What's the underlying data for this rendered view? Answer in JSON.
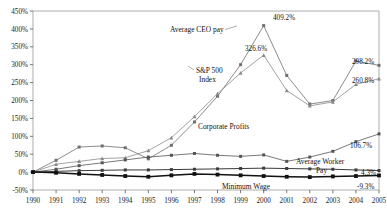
{
  "chart": {
    "type": "line",
    "title": "",
    "xlabel": "",
    "ylabel": "",
    "grid": false,
    "legend_position": "inline-annotations",
    "axis": {
      "ylim": [
        -50,
        450
      ],
      "ytick_step": 50,
      "ytick_labels": [
        "450%",
        "400%",
        "350%",
        "300%",
        "250%",
        "200%",
        "150%",
        "100%",
        "50%",
        "0%",
        "-50%"
      ],
      "ytick_values": [
        450,
        400,
        350,
        300,
        250,
        200,
        150,
        100,
        50,
        0,
        -50
      ],
      "xtick_labels": [
        "1990",
        "1991",
        "1992",
        "1993",
        "1994",
        "1995",
        "1996",
        "1997",
        "1998",
        "1999",
        "2000",
        "2001",
        "2002",
        "2003",
        "2004",
        "2005"
      ]
    },
    "categories": [
      1990,
      1991,
      1992,
      1993,
      1994,
      1995,
      1996,
      1997,
      1998,
      1999,
      2000,
      2001,
      2002,
      2003,
      2004,
      2005
    ],
    "series": [
      {
        "name": "Average CEO pay",
        "marker": "square",
        "color": "#6e6e6e",
        "values": [
          0,
          33,
          70,
          73,
          68,
          37,
          75,
          140,
          212,
          300,
          409.2,
          270,
          190,
          200,
          310,
          298.2
        ]
      },
      {
        "name": "S&P 500 Index",
        "marker": "triangle",
        "color": "#8a8a8a",
        "values": [
          0,
          22,
          30,
          38,
          40,
          60,
          96,
          155,
          219,
          277,
          326.6,
          228,
          185,
          196,
          245,
          260.8
        ]
      },
      {
        "name": "Corporate Profits",
        "marker": "square",
        "color": "#555555",
        "values": [
          0,
          8,
          18,
          26,
          34,
          42,
          47,
          52,
          47,
          44,
          48,
          30,
          42,
          58,
          85,
          106.7
        ]
      },
      {
        "name": "Average Worker Pay",
        "marker": "square",
        "color": "#3a3a3a",
        "values": [
          0,
          2,
          4,
          5,
          6,
          6,
          7,
          8,
          9,
          10,
          11,
          10,
          9,
          8,
          6,
          4.3
        ]
      },
      {
        "name": "Minimum Wage",
        "marker": "square",
        "color": "#111111",
        "values": [
          0,
          -2,
          -5,
          -8,
          -11,
          -13,
          -9,
          -5,
          -7,
          -9,
          -11,
          -13,
          -14,
          -12,
          -11,
          -9.3
        ]
      }
    ],
    "annotations": [
      {
        "name": "annotation-ceo-pay",
        "text": "Average CEO pay"
      },
      {
        "name": "annotation-sp500-line1",
        "text": "S&P 500"
      },
      {
        "name": "annotation-sp500-line2",
        "text": "Index"
      },
      {
        "name": "annotation-corporate-profits",
        "text": "Corporate Profits"
      },
      {
        "name": "annotation-worker-pay-line1",
        "text": "Average Worker"
      },
      {
        "name": "annotation-worker-pay-line2",
        "text": "Pay"
      },
      {
        "name": "annotation-minimum-wage",
        "text": "Minimum Wage"
      }
    ],
    "value_labels": [
      {
        "name": "value-label-ceo-peak",
        "text": "409.2%"
      },
      {
        "name": "value-label-sp500-peak",
        "text": "326.6%"
      },
      {
        "name": "value-label-ceo-end",
        "text": "298.2%"
      },
      {
        "name": "value-label-sp500-end",
        "text": "260.8%"
      },
      {
        "name": "value-label-profits-end",
        "text": "106.7%"
      },
      {
        "name": "value-label-worker-end",
        "text": "4.3%"
      },
      {
        "name": "value-label-minwage-end",
        "text": "-9.3%"
      }
    ]
  }
}
